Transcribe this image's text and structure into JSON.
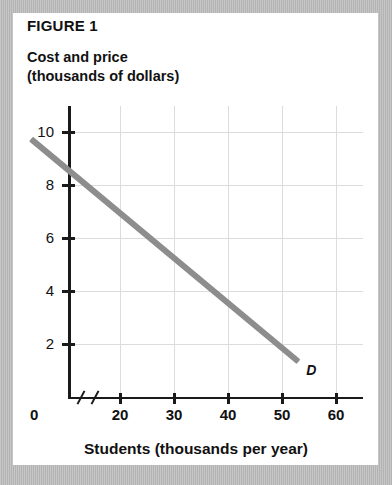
{
  "figure": {
    "label": "FIGURE 1",
    "y_axis_title_line1": "Cost and price",
    "y_axis_title_line2": "(thousands of dollars)",
    "x_axis_title": "Students (thousands per year)",
    "zero_label": "0",
    "curve_label": "D"
  },
  "colors": {
    "line": "#8d8d8d",
    "axis": "#1a1a1a",
    "grid": "#dcdcdc",
    "card": "#ffffff",
    "frame": "#bfbfbf"
  },
  "chart_data": {
    "type": "line",
    "title": "FIGURE 1",
    "subtitle": "Cost and price (thousands of dollars)",
    "xlabel": "Students (thousands per year)",
    "ylabel": "Cost and price (thousands of dollars)",
    "xlim": [
      10,
      65
    ],
    "ylim": [
      0,
      11
    ],
    "xticks": [
      20,
      30,
      40,
      50,
      60
    ],
    "yticks": [
      2,
      4,
      6,
      8,
      10
    ],
    "xtick_labels": [
      "20",
      "30",
      "40",
      "50",
      "60"
    ],
    "ytick_labels": [
      "2",
      "4",
      "6",
      "8",
      "10"
    ],
    "axis_break": true,
    "axis_break_note": "double slash between 0 and 20 on x-axis",
    "origin_label": "0",
    "grid": true,
    "legend": "none",
    "annotations": [
      {
        "text": "D",
        "x": 54.5,
        "y": 0.7,
        "style": "italic-bold"
      }
    ],
    "series": [
      {
        "name": "D",
        "label": "Demand curve",
        "color": "#8d8d8d",
        "points": [
          {
            "x": 3.5,
            "y": 9.7
          },
          {
            "x": 20,
            "y": 6.9
          },
          {
            "x": 30,
            "y": 6.0
          },
          {
            "x": 40,
            "y": 4.3
          },
          {
            "x": 50,
            "y": 2.6
          },
          {
            "x": 53,
            "y": 1.3
          }
        ],
        "endpoints": {
          "start": {
            "x": 3.5,
            "y": 9.7
          },
          "end": {
            "x": 53,
            "y": 1.3
          }
        },
        "slope": -0.17,
        "description": "downward sloping straight demand line"
      }
    ]
  }
}
